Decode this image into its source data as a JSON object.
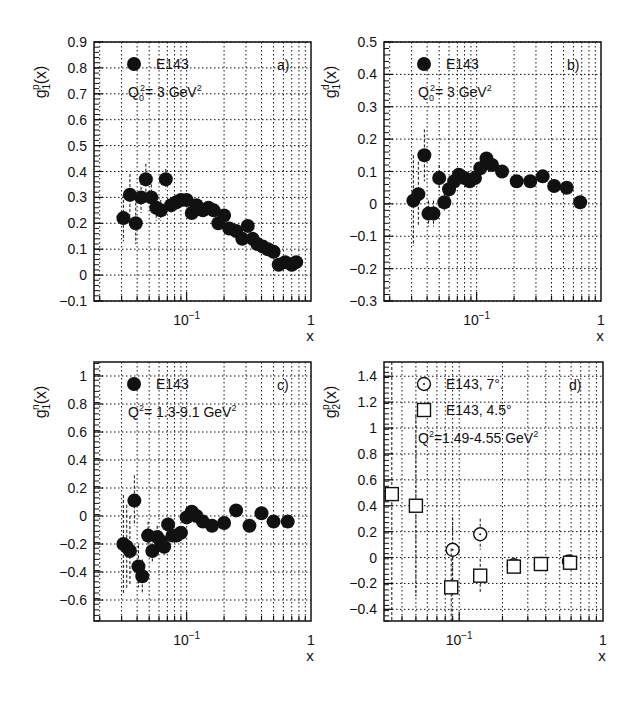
{
  "figure": {
    "background": "#ffffff",
    "ink": "#111111"
  },
  "chart_data": [
    {
      "id": "a",
      "type": "scatter",
      "panel_label": "a)",
      "ylabel": "g1^p(x)",
      "ylabel_parts": {
        "base": "g",
        "sub": "1",
        "sup": "p",
        "arg": "(x)"
      },
      "xlabel": "x",
      "xscale": "log",
      "xlim": [
        0.018,
        1.0
      ],
      "ylim": [
        -0.1,
        0.9
      ],
      "yticks": [
        -0.1,
        0,
        0.1,
        0.2,
        0.3,
        0.4,
        0.5,
        0.6,
        0.7,
        0.8,
        0.9
      ],
      "ytick_labels": [
        "-0.1",
        "0",
        "0.1",
        "0.2",
        "0.3",
        "0.4",
        "0.5",
        "0.6",
        "0.7",
        "0.8",
        "0.9"
      ],
      "xtick_labels": [
        {
          "value": 0.1,
          "label": "10",
          "exp": "-1"
        },
        {
          "value": 1.0,
          "label": "1",
          "exp": ""
        }
      ],
      "grid": true,
      "legend": [
        {
          "marker": "filled-circle",
          "label": "E143"
        }
      ],
      "annotation": "Q0² = 3 GeV²",
      "annotation_parts": {
        "q": "Q",
        "sub": "0",
        "rest": "= 3 GeV",
        "sup": "2"
      },
      "series": [
        {
          "name": "E143",
          "marker": "filled-circle",
          "x": [
            0.031,
            0.035,
            0.039,
            0.043,
            0.047,
            0.052,
            0.057,
            0.062,
            0.068,
            0.075,
            0.082,
            0.09,
            0.1,
            0.11,
            0.12,
            0.135,
            0.15,
            0.165,
            0.18,
            0.2,
            0.22,
            0.25,
            0.28,
            0.31,
            0.34,
            0.37,
            0.41,
            0.45,
            0.5,
            0.55,
            0.62,
            0.7,
            0.76
          ],
          "y": [
            0.22,
            0.31,
            0.2,
            0.3,
            0.37,
            0.3,
            0.26,
            0.25,
            0.37,
            0.27,
            0.28,
            0.29,
            0.29,
            0.24,
            0.27,
            0.25,
            0.26,
            0.25,
            0.2,
            0.23,
            0.18,
            0.17,
            0.14,
            0.19,
            0.14,
            0.12,
            0.11,
            0.1,
            0.09,
            0.04,
            0.05,
            0.04,
            0.05
          ],
          "yerr": [
            0.09,
            0.08,
            0.08,
            0.06,
            0.06,
            0.05,
            0.05,
            0.04,
            0.04,
            0.03,
            0.03,
            0.02,
            0.02,
            0.02,
            0.02,
            0.02,
            0.02,
            0.02,
            0.02,
            0.02,
            0.02,
            0.02,
            0.02,
            0.02,
            0.02,
            0.02,
            0.02,
            0.02,
            0.02,
            0.02,
            0.02,
            0.02,
            0.02
          ]
        }
      ]
    },
    {
      "id": "b",
      "type": "scatter",
      "panel_label": "b)",
      "ylabel": "g1^d(x)",
      "ylabel_parts": {
        "base": "g",
        "sub": "1",
        "sup": "d",
        "arg": "(x)"
      },
      "xlabel": "x",
      "xscale": "log",
      "xlim": [
        0.018,
        1.0
      ],
      "ylim": [
        -0.3,
        0.5
      ],
      "yticks": [
        -0.3,
        -0.2,
        -0.1,
        0,
        0.1,
        0.2,
        0.3,
        0.4,
        0.5
      ],
      "ytick_labels": [
        "-0.3",
        "-0.2",
        "-0.1",
        "0",
        "0.1",
        "0.2",
        "0.3",
        "0.4",
        "0.5"
      ],
      "xtick_labels": [
        {
          "value": 0.1,
          "label": "10",
          "exp": "-1"
        },
        {
          "value": 1.0,
          "label": "1",
          "exp": ""
        }
      ],
      "grid": true,
      "legend": [
        {
          "marker": "filled-circle",
          "label": "E143"
        }
      ],
      "annotation": "Q0² = 3 GeV²",
      "annotation_parts": {
        "q": "Q",
        "sub": "0",
        "rest": "= 3 GeV",
        "sup": "2"
      },
      "series": [
        {
          "name": "E143",
          "marker": "filled-circle",
          "x": [
            0.031,
            0.034,
            0.038,
            0.041,
            0.045,
            0.05,
            0.055,
            0.06,
            0.066,
            0.072,
            0.08,
            0.088,
            0.097,
            0.107,
            0.12,
            0.133,
            0.16,
            0.21,
            0.27,
            0.34,
            0.42,
            0.53,
            0.68
          ],
          "y": [
            0.01,
            0.03,
            0.15,
            -0.03,
            -0.03,
            0.08,
            0.005,
            0.045,
            0.07,
            0.09,
            0.08,
            0.07,
            0.08,
            0.11,
            0.14,
            0.12,
            0.1,
            0.07,
            0.07,
            0.085,
            0.055,
            0.05,
            0.005
          ],
          "yerr": [
            0.14,
            0.1,
            0.08,
            0.04,
            0.04,
            0.04,
            0.03,
            0.03,
            0.025,
            0.02,
            0.02,
            0.015,
            0.015,
            0.015,
            0.015,
            0.015,
            0.01,
            0.01,
            0.01,
            0.01,
            0.01,
            0.01,
            0.01
          ]
        }
      ]
    },
    {
      "id": "c",
      "type": "scatter",
      "panel_label": "c)",
      "ylabel": "g1^n(x)",
      "ylabel_parts": {
        "base": "g",
        "sub": "1",
        "sup": "n",
        "arg": "(x)"
      },
      "xlabel": "x",
      "xscale": "log",
      "xlim": [
        0.018,
        1.0
      ],
      "ylim": [
        -0.75,
        1.1
      ],
      "yticks": [
        -0.6,
        -0.4,
        -0.2,
        0,
        0.2,
        0.4,
        0.6,
        0.8,
        1.0
      ],
      "ytick_labels": [
        "-0.6",
        "-0.4",
        "-0.2",
        "0",
        "0.2",
        "0.4",
        "0.6",
        "0.8",
        "1"
      ],
      "xtick_labels": [
        {
          "value": 0.1,
          "label": "10",
          "exp": "-1"
        },
        {
          "value": 1.0,
          "label": "1",
          "exp": ""
        }
      ],
      "grid": true,
      "legend": [
        {
          "marker": "filled-circle",
          "label": "E143"
        }
      ],
      "annotation": "Q² = 1.3-9.1 GeV²",
      "annotation_parts": {
        "q": "Q",
        "sub": "",
        "sup1": "2",
        "rest": "= 1.3-9.1 GeV",
        "sup": "2"
      },
      "series": [
        {
          "name": "E143",
          "marker": "filled-circle",
          "x": [
            0.031,
            0.033,
            0.035,
            0.038,
            0.041,
            0.044,
            0.049,
            0.053,
            0.058,
            0.062,
            0.066,
            0.071,
            0.077,
            0.083,
            0.09,
            0.1,
            0.11,
            0.12,
            0.135,
            0.16,
            0.2,
            0.25,
            0.32,
            0.4,
            0.5,
            0.65
          ],
          "y": [
            -0.2,
            -0.22,
            -0.25,
            0.11,
            -0.36,
            -0.43,
            -0.14,
            -0.25,
            -0.15,
            -0.18,
            -0.22,
            -0.06,
            -0.14,
            -0.14,
            -0.12,
            -0.01,
            0.03,
            0.0,
            -0.04,
            -0.07,
            -0.05,
            0.04,
            -0.07,
            0.02,
            -0.04,
            -0.04
          ],
          "yerr": [
            0.35,
            0.3,
            0.25,
            0.18,
            0.15,
            0.12,
            0.1,
            0.09,
            0.08,
            0.07,
            0.06,
            0.05,
            0.05,
            0.04,
            0.04,
            0.04,
            0.03,
            0.03,
            0.03,
            0.03,
            0.03,
            0.03,
            0.03,
            0.03,
            0.03,
            0.03
          ]
        }
      ]
    },
    {
      "id": "d",
      "type": "scatter",
      "panel_label": "d)",
      "ylabel": "g2^p(x)",
      "ylabel_parts": {
        "base": "g",
        "sub": "2",
        "sup": "p",
        "arg": "(x)"
      },
      "xlabel": "x",
      "xscale": "log",
      "xlim": [
        0.03,
        1.0
      ],
      "ylim": [
        -0.49,
        1.51
      ],
      "yticks": [
        -0.4,
        -0.2,
        0,
        0.2,
        0.4,
        0.6,
        0.8,
        1.0,
        1.2,
        1.4
      ],
      "ytick_labels": [
        "-0.4",
        "-0.2",
        "0",
        "0.2",
        "0.4",
        "0.6",
        "0.8",
        "1",
        "1.2",
        "1.4"
      ],
      "xtick_labels": [
        {
          "value": 0.1,
          "label": "10",
          "exp": "-1"
        },
        {
          "value": 1.0,
          "label": "1",
          "exp": ""
        }
      ],
      "grid": true,
      "legend": [
        {
          "marker": "open-circle",
          "label": "E143, 7°."
        },
        {
          "marker": "open-square",
          "label": "E143, 4.5°"
        }
      ],
      "annotation": "Q² = 1.49-4.55 GeV²",
      "annotation_parts": {
        "q": "Q",
        "sub": "",
        "sup1": "2",
        "rest": "=1.49-4.55 GeV",
        "sup": "2"
      },
      "series": [
        {
          "name": "E143, 7°.",
          "marker": "open-circle",
          "x": [
            0.09,
            0.14,
            0.24,
            0.37,
            0.58
          ],
          "y": [
            0.06,
            0.18,
            -0.06,
            -0.05,
            -0.03
          ],
          "yerr": [
            0.25,
            0.12,
            0.06,
            0.04,
            0.04
          ]
        },
        {
          "name": "E143, 4.5°",
          "marker": "open-square",
          "x": [
            0.034,
            0.05,
            0.088,
            0.14,
            0.24,
            0.37,
            0.59
          ],
          "y": [
            0.49,
            0.4,
            -0.23,
            -0.14,
            -0.07,
            -0.05,
            -0.04
          ],
          "yerr": [
            1.6,
            0.7,
            0.3,
            0.13,
            0.05,
            0.04,
            0.03
          ]
        }
      ]
    }
  ],
  "layout": {
    "panels": {
      "a": {
        "left": 94,
        "top": 42,
        "right": 311,
        "bottom": 301
      },
      "b": {
        "left": 384,
        "top": 42,
        "right": 601,
        "bottom": 301
      },
      "c": {
        "left": 94,
        "top": 362,
        "right": 311,
        "bottom": 621
      },
      "d": {
        "left": 384,
        "top": 362,
        "right": 603,
        "bottom": 621
      }
    }
  }
}
